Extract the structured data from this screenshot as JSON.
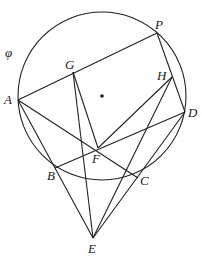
{
  "diagram": {
    "title": "",
    "circle_label": "φ",
    "points": {
      "P": {
        "label": "P"
      },
      "G": {
        "label": "G"
      },
      "H": {
        "label": "H"
      },
      "A": {
        "label": "A"
      },
      "D": {
        "label": "D"
      },
      "F": {
        "label": "F"
      },
      "B": {
        "label": "B"
      },
      "C": {
        "label": "C"
      },
      "E": {
        "label": "E"
      }
    },
    "segments": [
      [
        "A",
        "P"
      ],
      [
        "P",
        "D"
      ],
      [
        "A",
        "C"
      ],
      [
        "A",
        "E"
      ],
      [
        "B",
        "D"
      ],
      [
        "G",
        "E"
      ],
      [
        "G",
        "F"
      ],
      [
        "H",
        "F"
      ],
      [
        "H",
        "E"
      ],
      [
        "D",
        "E"
      ]
    ],
    "circle": {
      "name": "φ",
      "through": [
        "P",
        "A",
        "B",
        "C",
        "D"
      ],
      "center_marked": true
    },
    "colors": {
      "ink": "#222222",
      "background": "#ffffff"
    }
  }
}
